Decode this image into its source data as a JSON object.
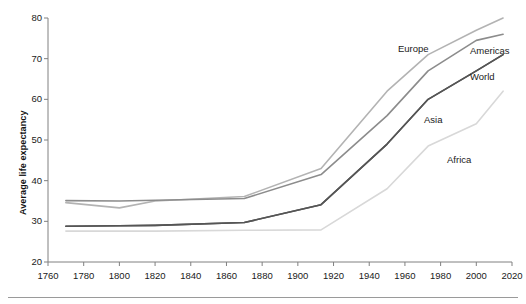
{
  "chart_data": {
    "type": "line",
    "title": "",
    "subtitle": "",
    "xlabel": "",
    "ylabel": "Average life expectancy",
    "xlim": [
      1760,
      2020
    ],
    "ylim": [
      20,
      80
    ],
    "xticks": [
      1760,
      1780,
      1800,
      1820,
      1840,
      1860,
      1880,
      1900,
      1920,
      1940,
      1960,
      1980,
      2000,
      2020
    ],
    "yticks": [
      20,
      30,
      40,
      50,
      60,
      70,
      80
    ],
    "grid": false,
    "legend_position": "inline-right-labels",
    "series": [
      {
        "name": "Europe",
        "color": "#b3b3b3",
        "x": [
          1770,
          1800,
          1820,
          1870,
          1913,
          1950,
          1973,
          2000,
          2015
        ],
        "values": [
          34.6,
          33.3,
          35.0,
          36.1,
          43.0,
          62.0,
          71.0,
          77.0,
          80.0
        ]
      },
      {
        "name": "Americas",
        "color": "#8c8c8c",
        "x": [
          1770,
          1800,
          1820,
          1870,
          1913,
          1950,
          1973,
          2000,
          2015
        ],
        "values": [
          35.1,
          35.0,
          35.2,
          35.6,
          41.5,
          56.0,
          67.0,
          74.5,
          76.0
        ]
      },
      {
        "name": "World",
        "color": "#555555",
        "x": [
          1770,
          1800,
          1820,
          1870,
          1913,
          1950,
          1973,
          2000,
          2015
        ],
        "values": [
          28.8,
          28.9,
          29.0,
          29.7,
          34.1,
          49.0,
          60.0,
          67.0,
          71.0
        ]
      },
      {
        "name": "Asia",
        "color": "#555555",
        "x": [
          1770,
          1800,
          1820,
          1870,
          1913,
          1950,
          1973,
          2000,
          2015
        ],
        "values": [
          28.8,
          28.9,
          29.0,
          29.7,
          34.1,
          49.0,
          60.0,
          67.0,
          71.0
        ]
      },
      {
        "name": "Africa",
        "color": "#d8d8d8",
        "x": [
          1770,
          1800,
          1820,
          1870,
          1913,
          1950,
          1973,
          2000,
          2015
        ],
        "values": [
          27.6,
          27.6,
          27.6,
          27.8,
          27.9,
          38.0,
          48.5,
          54.0,
          62.0
        ]
      }
    ],
    "series_labels": [
      {
        "name": "Europe",
        "text": "Europe",
        "x_px": 398,
        "y_px": 43
      },
      {
        "name": "Americas",
        "text": "Americas",
        "x_px": 470,
        "y_px": 45
      },
      {
        "name": "World",
        "text": "World",
        "x_px": 470,
        "y_px": 71
      },
      {
        "name": "Asia",
        "text": "Asia",
        "x_px": 424,
        "y_px": 114
      },
      {
        "name": "Africa",
        "text": "Africa",
        "x_px": 447,
        "y_px": 154
      }
    ]
  },
  "axes": {
    "y_title": "Average life expectancy",
    "y_tick_labels": [
      "80",
      "70",
      "60",
      "50",
      "40",
      "30",
      "20"
    ],
    "x_tick_labels": [
      "1760",
      "1780",
      "1800",
      "1820",
      "1840",
      "1860",
      "1880",
      "1900",
      "1920",
      "1940",
      "1960",
      "1980",
      "2000",
      "2020"
    ]
  },
  "colors": {
    "axis": "#808080",
    "text": "#1a1a1a",
    "background": "#ffffff",
    "rule": "#9a9a9a"
  }
}
